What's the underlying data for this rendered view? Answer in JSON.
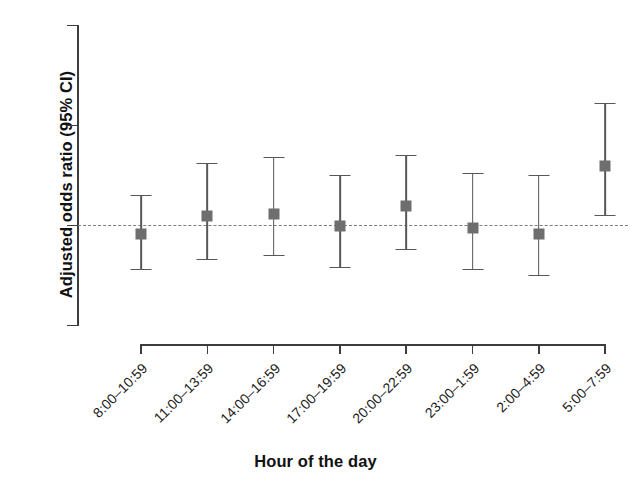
{
  "chart_data": {
    "type": "scatter",
    "title": "",
    "xlabel": "Hour of the day",
    "ylabel": "Adjusted odds ratio (95% CI)",
    "ylim": [
      0.5,
      2.0
    ],
    "yticks": [
      "0.5",
      "1.0",
      "1.5",
      "2.0"
    ],
    "ytick_values": [
      0.5,
      1.0,
      1.5,
      2.0
    ],
    "grid": false,
    "legend": "none",
    "reference_line": {
      "value": 1.0,
      "style": "dashed",
      "color": "#7d7d7d"
    },
    "marker": {
      "shape": "square",
      "color": "#6e6e6e",
      "errorbar_color": "#575757"
    },
    "categories": [
      "8:00–10:59",
      "11:00–13:59",
      "14:00–16:59",
      "17:00–19:59",
      "20:00–22:59",
      "23:00–1:59",
      "2:00–4:59",
      "5:00–7:59"
    ],
    "values": [
      0.96,
      1.05,
      1.06,
      1.0,
      1.1,
      0.99,
      0.96,
      1.3
    ],
    "ci_lower": [
      0.78,
      0.83,
      0.85,
      0.79,
      0.88,
      0.78,
      0.75,
      1.05
    ],
    "ci_upper": [
      1.15,
      1.31,
      1.34,
      1.25,
      1.35,
      1.26,
      1.25,
      1.61
    ],
    "points": [
      {
        "category": "8:00–10:59",
        "or": 0.96,
        "lo": 0.78,
        "hi": 1.15
      },
      {
        "category": "11:00–13:59",
        "or": 1.05,
        "lo": 0.83,
        "hi": 1.31
      },
      {
        "category": "14:00–16:59",
        "or": 1.06,
        "lo": 0.85,
        "hi": 1.34
      },
      {
        "category": "17:00–19:59",
        "or": 1.0,
        "lo": 0.79,
        "hi": 1.25
      },
      {
        "category": "20:00–22:59",
        "or": 1.1,
        "lo": 0.88,
        "hi": 1.35
      },
      {
        "category": "23:00–1:59",
        "or": 0.99,
        "lo": 0.78,
        "hi": 1.26
      },
      {
        "category": "2:00–4:59",
        "or": 0.96,
        "lo": 0.75,
        "hi": 1.25
      },
      {
        "category": "5:00–7:59",
        "or": 1.3,
        "lo": 1.05,
        "hi": 1.61
      }
    ]
  },
  "axis": {
    "y_title": "Adjusted odds ratio (95% CI)",
    "x_title": "Hour of the day"
  }
}
